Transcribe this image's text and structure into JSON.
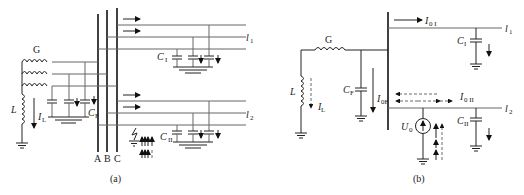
{
  "figure_a": {
    "caption": "(a)",
    "generator_label": "G",
    "inductor_label": "L",
    "inductor_current_label": "I",
    "inductor_current_sub": "L",
    "gen_cap_label": "C",
    "gen_cap_sub": "F",
    "bus_labels": [
      "A",
      "B",
      "C"
    ],
    "line1_label": "l",
    "line1_sub": "1",
    "line1_cap_label": "C",
    "line1_cap_sub": "I",
    "line2_label": "l",
    "line2_sub": "2",
    "line2_cap_label": "C",
    "line2_cap_sub": "II"
  },
  "figure_b": {
    "caption": "(b)",
    "generator_label": "G",
    "inductor_label": "L",
    "inductor_current_label": "I",
    "inductor_current_sub": "L",
    "gen_cap_label": "C",
    "gen_cap_sub": "F",
    "gen_current_label": "I",
    "gen_current_sub": "0F",
    "line1_current_label": "I",
    "line1_current_sub": "0 I",
    "line1_label": "l",
    "line1_sub": "1",
    "line1_cap_label": "C",
    "line1_cap_sub": "I",
    "line2_current_label": "I",
    "line2_current_sub": "0 II",
    "line2_label": "l",
    "line2_sub": "2",
    "line2_cap_label": "C",
    "line2_cap_sub": "II",
    "source_label": "U",
    "source_sub": "0"
  }
}
